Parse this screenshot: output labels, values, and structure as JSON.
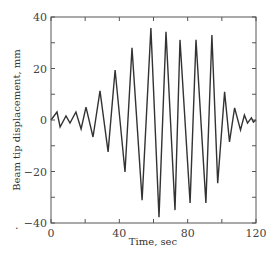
{
  "chart_data": {
    "type": "line",
    "title": "",
    "xlabel": "Time, sec",
    "ylabel": "Beam tip displacement, mm",
    "xlim": [
      0,
      120
    ],
    "ylim": [
      -40,
      40
    ],
    "x_ticks": [
      0,
      20,
      40,
      60,
      80,
      100,
      120
    ],
    "x_tick_labels": [
      "0",
      "",
      "40",
      "",
      "80",
      "",
      "120"
    ],
    "y_ticks": [
      -40,
      -30,
      -20,
      -10,
      0,
      10,
      20,
      30,
      40
    ],
    "y_tick_labels": [
      "-40",
      "",
      "-20",
      "",
      "0",
      "",
      "20",
      "",
      "40"
    ],
    "grid": false,
    "legend": null,
    "series": [
      {
        "name": "Beam tip displacement",
        "color": "#333333",
        "x": [
          0,
          3.5,
          5.3,
          8.8,
          11.1,
          14.6,
          17.6,
          20.5,
          24.6,
          28.7,
          33.4,
          37.5,
          43.3,
          47.4,
          53.3,
          58.5,
          63.2,
          67.3,
          72.6,
          75.5,
          81.4,
          84.9,
          90.7,
          94.2,
          97.6,
          101.6,
          104.5,
          107.5,
          110.9,
          113.2,
          115.0,
          117.3,
          118.5,
          120
        ],
        "y": [
          0,
          3.1,
          -2.7,
          1.6,
          -1.2,
          3.1,
          -3.5,
          5.0,
          -6.6,
          11.3,
          -12.4,
          19.4,
          -20.2,
          28.0,
          -31.1,
          35.7,
          -37.7,
          34.2,
          -35.0,
          31.1,
          -32.2,
          31.1,
          -32.2,
          33.0,
          -24.5,
          10.9,
          -8.5,
          4.7,
          -3.9,
          1.9,
          -1.2,
          0.8,
          -0.8,
          0
        ]
      }
    ]
  },
  "annotations": {
    "stray_mark": "."
  }
}
